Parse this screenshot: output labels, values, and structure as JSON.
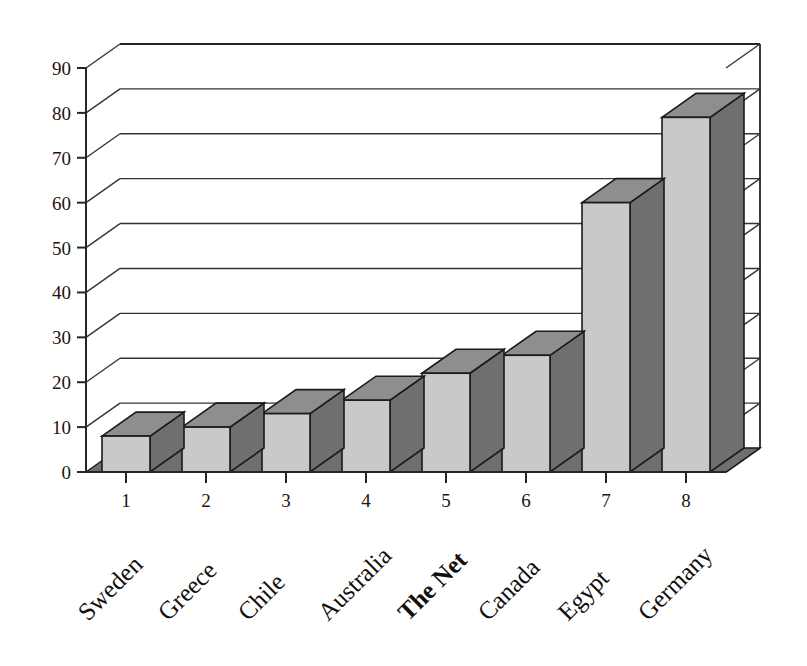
{
  "chart_data": {
    "type": "bar",
    "title": "",
    "subtitle": "",
    "xlabel": "",
    "ylabel": "",
    "ylim": [
      0,
      90
    ],
    "ytick_step": 10,
    "yticks": [
      0,
      10,
      20,
      30,
      40,
      50,
      60,
      70,
      80,
      90
    ],
    "grid": true,
    "legend": false,
    "three_d": true,
    "categories": [
      "Sweden",
      "Greece",
      "Chile",
      "Australia",
      "The Net",
      "Canada",
      "Egypt",
      "Germany"
    ],
    "category_numbers": [
      "1",
      "2",
      "3",
      "4",
      "5",
      "6",
      "7",
      "8"
    ],
    "values": [
      8,
      10,
      13,
      16,
      22,
      26,
      60,
      79
    ],
    "highlighted_category": "The Net",
    "series": [
      {
        "name": "",
        "values": [
          8,
          10,
          13,
          16,
          22,
          26,
          60,
          79
        ]
      }
    ],
    "colors": {
      "bar_front": "#c9c9c9",
      "bar_side": "#6f6f6f",
      "bar_top": "#8e8e8e",
      "outline": "#1d1a17",
      "grid": "#3a332d",
      "background": "#ffffff",
      "text": "#15110f"
    }
  },
  "axis": {
    "y_tick_labels": [
      "90",
      "80",
      "70",
      "60",
      "50",
      "40",
      "30",
      "20",
      "10",
      "0"
    ],
    "x_tick_labels": [
      "1",
      "2",
      "3",
      "4",
      "5",
      "6",
      "7",
      "8"
    ]
  },
  "categories_detail": [
    {
      "number": "1",
      "name": "Sweden",
      "value": 8,
      "bold": false
    },
    {
      "number": "2",
      "name": "Greece",
      "value": 10,
      "bold": false
    },
    {
      "number": "3",
      "name": "Chile",
      "value": 13,
      "bold": false
    },
    {
      "number": "4",
      "name": "Australia",
      "value": 16,
      "bold": false
    },
    {
      "number": "5",
      "name": "The Net",
      "value": 22,
      "bold": true
    },
    {
      "number": "6",
      "name": "Canada",
      "value": 26,
      "bold": false
    },
    {
      "number": "7",
      "name": "Egypt",
      "value": 60,
      "bold": false
    },
    {
      "number": "8",
      "name": "Germany",
      "value": 79,
      "bold": false
    }
  ]
}
